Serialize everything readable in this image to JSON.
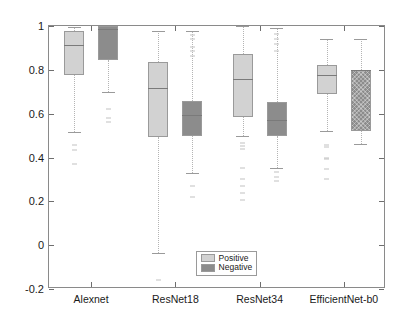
{
  "chart_data": {
    "type": "box",
    "title": "",
    "xlabel": "",
    "ylabel": "Correlation Coefficient",
    "categories": [
      "Alexnet",
      "ResNet18",
      "ResNet34",
      "EfficientNet-b0"
    ],
    "ylim": [
      -0.2,
      1.0
    ],
    "yticks": [
      1,
      0.8,
      0.6,
      0.4,
      0.2,
      0,
      -0.2
    ],
    "ytick_labels": [
      "1",
      "0.8",
      "0.6",
      "0.4",
      "0.2",
      "0",
      "-0.2"
    ],
    "grid": false,
    "legend": {
      "position": "bottom-right",
      "entries": [
        {
          "label": "Positive",
          "color": "#d2d2d2"
        },
        {
          "label": "Negative",
          "color": "#8c8c8c"
        }
      ]
    },
    "series": [
      {
        "name": "Positive",
        "color": "#d2d2d2",
        "boxes": [
          {
            "category": "Alexnet",
            "whisker_low": 0.515,
            "q1": 0.775,
            "median": 0.912,
            "q3": 0.975,
            "whisker_high": 0.995,
            "outliers": [
              0.455,
              0.432,
              0.372
            ]
          },
          {
            "category": "ResNet18",
            "whisker_low": -0.035,
            "q1": 0.495,
            "median": 0.715,
            "q3": 0.835,
            "whisker_high": 0.975,
            "outliers": [
              -0.158
            ]
          },
          {
            "category": "ResNet34",
            "whisker_low": 0.5,
            "q1": 0.585,
            "median": 0.76,
            "q3": 0.872,
            "whisker_high": 0.998,
            "outliers": [
              0.468,
              0.452,
              0.437,
              0.352,
              0.3,
              0.272,
              0.238,
              0.205
            ]
          },
          {
            "category": "EfficientNet-b0",
            "whisker_low": 0.52,
            "q1": 0.69,
            "median": 0.775,
            "q3": 0.82,
            "whisker_high": 0.94,
            "outliers": [
              0.455,
              0.448,
              0.398,
              0.392,
              0.348,
              0.3
            ]
          }
        ]
      },
      {
        "name": "Negative",
        "color": "#8c8c8c",
        "boxes": [
          {
            "category": "Alexnet",
            "whisker_low": 0.7,
            "q1": 0.845,
            "median": 0.985,
            "q3": 1.0,
            "whisker_high": 1.0,
            "outliers": [
              0.62,
              0.578,
              0.562
            ]
          },
          {
            "category": "ResNet18",
            "whisker_low": 0.33,
            "q1": 0.5,
            "median": 0.592,
            "q3": 0.66,
            "whisker_high": 0.975,
            "outliers": [
              0.96,
              0.94,
              0.905,
              0.885,
              0.862,
              0.268,
              0.218
            ]
          },
          {
            "category": "ResNet34",
            "whisker_low": 0.352,
            "q1": 0.5,
            "median": 0.572,
            "q3": 0.655,
            "whisker_high": 0.992,
            "outliers": [
              0.962,
              0.94,
              0.918,
              0.888,
              0.332,
              0.31,
              0.295
            ]
          },
          {
            "category": "EfficientNet-b0",
            "whisker_low": 0.462,
            "q1": 0.52,
            "median": 0.8,
            "q3": 0.8,
            "whisker_high": 0.94,
            "outliers": []
          }
        ]
      }
    ]
  }
}
